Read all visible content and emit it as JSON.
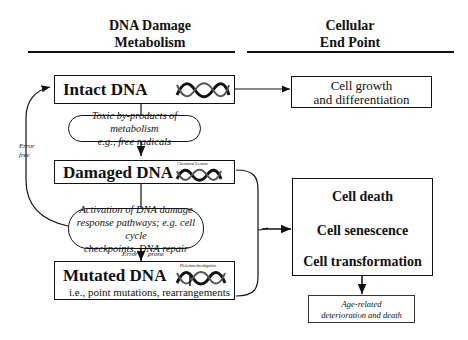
{
  "headers": {
    "left": {
      "line1": "DNA Damage",
      "line2": "Metabolism"
    },
    "right": {
      "line1": "Cellular",
      "line2": "End Point"
    }
  },
  "nodes": {
    "intact": {
      "label": "Intact DNA"
    },
    "toxic": {
      "line1": "Toxic by-products of metabolism",
      "line2": "e.g., free radicals"
    },
    "damaged": {
      "label": "Damaged DNA",
      "dna_caption": "Chemical Lesion"
    },
    "activation": {
      "line1": "Activation of DNA damage",
      "line2": "response pathways;  e.g. cell cycle",
      "line3": "checkpoints, DNA repair"
    },
    "mutated": {
      "label": "Mutated DNA",
      "dna_caption": "Deletion breakpoint",
      "subtitle": "i.e., point mutations, rearrangements"
    },
    "growth": {
      "line1": "Cell growth",
      "line2": "and differentiation"
    },
    "endpoints": {
      "item1": "Cell death",
      "item2": "Cell senescence",
      "item3": "Cell transformation"
    },
    "aging": {
      "line1": "Age-related",
      "line2": "deterioration and death"
    }
  },
  "edge_labels": {
    "error_free": {
      "line1": "Error",
      "line2": "free"
    },
    "error_prone": {
      "left": "Error",
      "right": "prone"
    }
  },
  "icons": {
    "dna_helix": "dna-helix-icon"
  }
}
